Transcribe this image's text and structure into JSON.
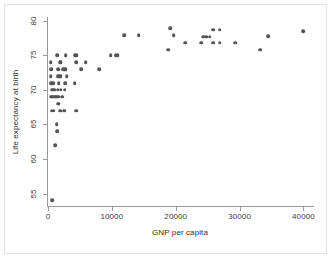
{
  "chart_data": {
    "type": "scatter",
    "title": "",
    "xlabel": "GNP per capita",
    "ylabel": "Life expectancy at birth",
    "xlim": [
      0,
      41500
    ],
    "ylim": [
      53.2,
      80.4
    ],
    "xticks": [
      0,
      10000,
      20000,
      30000,
      40000
    ],
    "xtick_labels": [
      "0",
      "10000",
      "20000",
      "30000",
      "40000"
    ],
    "yticks": [
      55,
      60,
      65,
      70,
      75,
      80
    ],
    "ytick_labels": [
      "55",
      "60",
      "65",
      "70",
      "75",
      "80"
    ],
    "grid": "horizontal",
    "legend": "none",
    "marker": {
      "shape": "circle",
      "color": "#545454",
      "size": 3.6
    },
    "points": [
      [
        700,
        54
      ],
      [
        1100,
        62
      ],
      [
        1400,
        64
      ],
      [
        1350,
        65
      ],
      [
        600,
        67
      ],
      [
        900,
        67
      ],
      [
        1900,
        67
      ],
      [
        2500,
        67
      ],
      [
        4400,
        67
      ],
      [
        1600,
        68
      ],
      [
        1650,
        68
      ],
      [
        500,
        69
      ],
      [
        700,
        69
      ],
      [
        900,
        69
      ],
      [
        1100,
        69
      ],
      [
        1300,
        69
      ],
      [
        1500,
        69
      ],
      [
        1700,
        69
      ],
      [
        2200,
        69
      ],
      [
        550,
        70
      ],
      [
        800,
        70
      ],
      [
        1050,
        70
      ],
      [
        1500,
        70
      ],
      [
        2000,
        70
      ],
      [
        2600,
        70
      ],
      [
        400,
        71
      ],
      [
        600,
        71
      ],
      [
        800,
        71
      ],
      [
        1700,
        71
      ],
      [
        2700,
        71
      ],
      [
        4200,
        71
      ],
      [
        450,
        72
      ],
      [
        1500,
        72
      ],
      [
        1750,
        72
      ],
      [
        2000,
        72
      ],
      [
        2900,
        72
      ],
      [
        500,
        73
      ],
      [
        1600,
        73
      ],
      [
        2400,
        73
      ],
      [
        2600,
        73
      ],
      [
        2800,
        73
      ],
      [
        5200,
        73
      ],
      [
        8000,
        73
      ],
      [
        400,
        74
      ],
      [
        1900,
        74
      ],
      [
        2000,
        74
      ],
      [
        4400,
        74
      ],
      [
        5900,
        74
      ],
      [
        1450,
        75
      ],
      [
        2800,
        75
      ],
      [
        4300,
        75
      ],
      [
        4500,
        75
      ],
      [
        9800,
        75
      ],
      [
        10600,
        75
      ],
      [
        10900,
        75
      ],
      [
        18800,
        75.8
      ],
      [
        33200,
        75.8
      ],
      [
        21500,
        76.8
      ],
      [
        24000,
        76.8
      ],
      [
        25900,
        76.8
      ],
      [
        26900,
        76.8
      ],
      [
        29300,
        76.8
      ],
      [
        24300,
        77.7
      ],
      [
        24800,
        77.7
      ],
      [
        25300,
        77.7
      ],
      [
        11900,
        77.9
      ],
      [
        14200,
        77.9
      ],
      [
        19700,
        77.9
      ],
      [
        34500,
        77.8
      ],
      [
        40000,
        78.5
      ],
      [
        25900,
        78.7
      ],
      [
        26900,
        78.7
      ],
      [
        19100,
        78.9
      ]
    ]
  }
}
